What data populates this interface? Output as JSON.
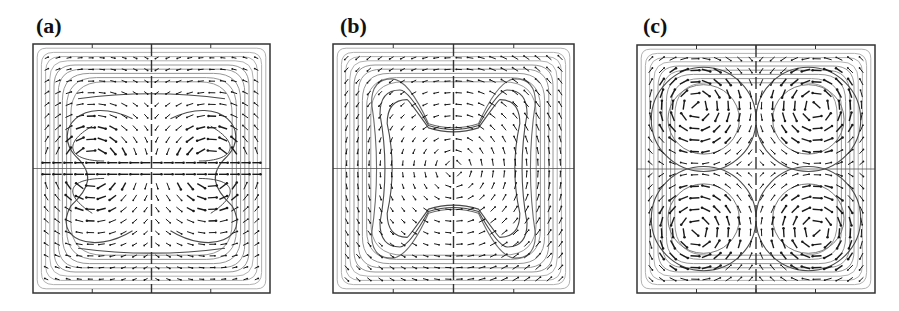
{
  "figure": {
    "panels": [
      {
        "id": "a",
        "label": "(a)",
        "pattern": "two-lobe",
        "box": {
          "x": 33,
          "y": 44,
          "w": 237,
          "h": 249
        },
        "label_pos": {
          "x": 36,
          "y": 15
        }
      },
      {
        "id": "b",
        "label": "(b)",
        "pattern": "dogbone",
        "box": {
          "x": 333,
          "y": 44,
          "w": 241,
          "h": 249
        },
        "label_pos": {
          "x": 340,
          "y": 15
        }
      },
      {
        "id": "c",
        "label": "(c)",
        "pattern": "four-cell",
        "box": {
          "x": 637,
          "y": 45,
          "w": 238,
          "h": 248
        },
        "label_pos": {
          "x": 643,
          "y": 15
        }
      }
    ],
    "colors": {
      "frame": "#333333",
      "streamline_outer": "#9a9a9a",
      "streamline_inner": "#4a4a4a",
      "arrow": "#1a1a1a",
      "background": "#ffffff"
    }
  }
}
